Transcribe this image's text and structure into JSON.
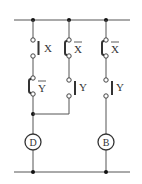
{
  "diagram": {
    "type": "relay-contact-circuit",
    "rails": [
      "top-rail",
      "bottom-rail"
    ],
    "branches": [
      {
        "id": "branch-1",
        "contacts": [
          {
            "label": "X",
            "type": "normally-open",
            "overbar": false
          },
          {
            "label": "Y",
            "type": "normally-closed",
            "overbar": true
          }
        ]
      },
      {
        "id": "branch-2",
        "contacts": [
          {
            "label": "X",
            "type": "normally-closed",
            "overbar": true
          },
          {
            "label": "Y",
            "type": "normally-open",
            "overbar": false
          }
        ],
        "joins": "branch-1"
      },
      {
        "id": "branch-3",
        "contacts": [
          {
            "label": "X",
            "type": "normally-closed",
            "overbar": true
          },
          {
            "label": "Y",
            "type": "normally-open",
            "overbar": false
          }
        ]
      }
    ],
    "loads": [
      {
        "label": "D",
        "branch": "branch-1"
      },
      {
        "label": "B",
        "branch": "branch-3"
      }
    ]
  }
}
